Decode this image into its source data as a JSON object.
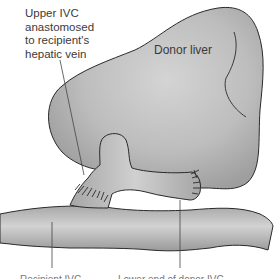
{
  "figure": {
    "type": "anatomical-illustration",
    "colors": {
      "tissue_fill": "#b8b8b8",
      "tissue_highlight": "#d9d9d9",
      "outline": "#2a2a2a",
      "leader_line": "#444444",
      "background": "#ffffff"
    }
  },
  "labels": {
    "upper_ivc": [
      "Upper IVC",
      "anastomosed",
      "to recipient's",
      "hepatic vein"
    ],
    "donor_liver": "Donor liver",
    "bottom_left_truncated": "Recipient IVC",
    "bottom_right_truncated": "Lower end of donor IVC"
  }
}
